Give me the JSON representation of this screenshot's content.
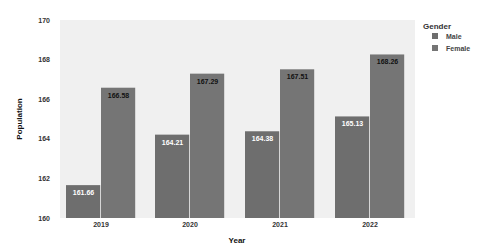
{
  "chart_data": {
    "type": "bar",
    "title": "",
    "xlabel": "Year",
    "ylabel": "Population",
    "categories": [
      "2019",
      "2020",
      "2021",
      "2022"
    ],
    "series": [
      {
        "name": "Male",
        "values": [
          161.66,
          164.21,
          164.38,
          165.13
        ],
        "labels": [
          "161.66",
          "164.21",
          "164.38",
          "165.13"
        ],
        "color": "#6e6e6e",
        "label_color": "#ffffff"
      },
      {
        "name": "Female",
        "values": [
          166.58,
          167.29,
          167.51,
          168.26
        ],
        "labels": [
          "166.58",
          "167.29",
          "167.51",
          "168.26"
        ],
        "color": "#757575",
        "label_color": "#111111"
      }
    ],
    "ylim": [
      160,
      170
    ],
    "yticks": [
      "160",
      "162",
      "164",
      "166",
      "168",
      "170"
    ],
    "grid": false,
    "legend": {
      "title": "Gender",
      "position": "right",
      "entries": [
        "Male",
        "Female"
      ]
    },
    "panel_background": "#f0f0f0"
  }
}
